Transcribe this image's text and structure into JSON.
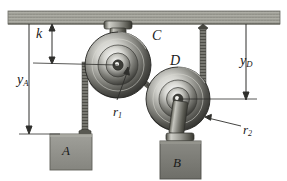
{
  "figure": {
    "background_color": "#ffffff",
    "width": 287,
    "height": 181
  },
  "ceiling": {
    "name": "ceiling",
    "color": "#9a9a92",
    "edge_color": "#6f6f68"
  },
  "labels": {
    "k": "k",
    "y_A_base": "y",
    "y_A_sub": "A",
    "y_D_base": "y",
    "y_D_sub": "D",
    "pulley_C": "C",
    "pulley_D": "D",
    "r1_base": "r",
    "r1_sub": "1",
    "r2_base": "r",
    "r2_sub": "2",
    "block_A": "A",
    "block_B": "B"
  },
  "components": {
    "pulley_C": {
      "name": "pulley-C",
      "center_x": 118,
      "center_y": 65,
      "outer_radius": 33,
      "label": "C"
    },
    "pulley_D": {
      "name": "pulley-D",
      "center_x": 178,
      "center_y": 99,
      "outer_radius": 32,
      "label": "D"
    },
    "block_A": {
      "name": "block-A",
      "x": 50,
      "y": 130,
      "width": 42,
      "height": 38,
      "fill": "#8e8e88",
      "label": "A"
    },
    "block_B": {
      "name": "block-B",
      "x": 160,
      "y": 142,
      "width": 41,
      "height": 38,
      "fill": "#7d7d77",
      "label": "B"
    }
  },
  "dimensions": {
    "k": {
      "label": "k",
      "from": "ceiling",
      "to": "pulley-C-center-level"
    },
    "y_A": {
      "label": "yA",
      "from": "ceiling",
      "to": "block-A-top"
    },
    "y_D": {
      "label": "yD",
      "from": "ceiling",
      "to": "pulley-D-center-level"
    },
    "r1": {
      "label": "r1",
      "refers_to": "pulley-C-inner-hub-radius"
    },
    "r2": {
      "label": "r2",
      "refers_to": "pulley-D-outer-rim-radius"
    }
  },
  "ropes": {
    "rope_A": "vertical rope from pulley C left groove down to block A",
    "rope_CD": "rope segment wrapping pulley C and pulley D",
    "rope_ceiling": "vertical rope from ceiling anchor down along right side of pulley D"
  },
  "colors": {
    "line": "#3a3a3a",
    "rope": "#6e6e68",
    "metal_dark": "#4a4a46",
    "metal_light": "#c9c9c4"
  }
}
